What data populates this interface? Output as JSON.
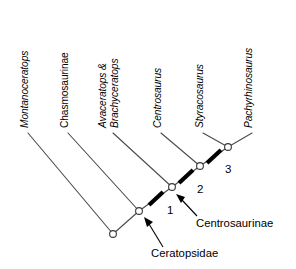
{
  "figure": {
    "type": "cladogram",
    "background_color": "#ffffff",
    "branch_color": "#4a4a4a",
    "node_fill": "#ffffff",
    "node_stroke": "#3a3a3a",
    "tick_color": "#000000"
  },
  "taxa": [
    {
      "id": "montanoceratops",
      "label": "Montanoceratops",
      "italic": true,
      "lines": [
        "Montanoceratops"
      ],
      "label_x": 28,
      "label_y": 126,
      "tip_x": 28,
      "tip_y": 133
    },
    {
      "id": "chasmosaurinae",
      "label": "Chasmosaurinae",
      "italic": false,
      "lines": [
        "Chasmosaurinae"
      ],
      "label_x": 68,
      "label_y": 126,
      "tip_x": 68,
      "tip_y": 133
    },
    {
      "id": "avaceratops-brachyceratops",
      "label": "Avaceratops & Brachyceratops",
      "italic": true,
      "lines": [
        "Avaceratops &",
        "Brachyceratops"
      ],
      "label_x": 113,
      "label_y": 126,
      "tip_x": 113,
      "tip_y": 133
    },
    {
      "id": "centrosaurus",
      "label": "Centrosaurus",
      "italic": true,
      "lines": [
        "Centrosaurus"
      ],
      "label_x": 161,
      "label_y": 126,
      "tip_x": 161,
      "tip_y": 133
    },
    {
      "id": "styracosaurus",
      "label": "Styracosaurus",
      "italic": true,
      "lines": [
        "Styracosaurus"
      ],
      "label_x": 203,
      "label_y": 126,
      "tip_x": 203,
      "tip_y": 133
    },
    {
      "id": "pachyrhinosaurus",
      "label": "Pachyrhinosaurus",
      "italic": true,
      "lines": [
        "Pachyrhinosaurus"
      ],
      "label_x": 252,
      "label_y": 126,
      "tip_x": 252,
      "tip_y": 133
    }
  ],
  "nodes": [
    {
      "id": "root",
      "x": 113,
      "y": 234
    },
    {
      "id": "ceratopsidae",
      "x": 139,
      "y": 211
    },
    {
      "id": "centrosaurinae",
      "x": 172,
      "y": 187
    },
    {
      "id": "node-2-above",
      "x": 200,
      "y": 166
    },
    {
      "id": "node-3-above",
      "x": 228,
      "y": 147
    }
  ],
  "tick_marks": [
    {
      "number": "1",
      "x": 156,
      "y": 198,
      "label_x": 166,
      "label_y": 213
    },
    {
      "number": "2",
      "x": 186,
      "y": 176,
      "label_x": 196,
      "label_y": 192
    },
    {
      "number": "3",
      "x": 214,
      "y": 156,
      "label_x": 224,
      "label_y": 172
    }
  ],
  "clade_labels": [
    {
      "id": "centrosaurinae-label",
      "text": "Centrosaurinae",
      "text_x": 196,
      "text_y": 226,
      "arrow_from_x": 197,
      "arrow_from_y": 216,
      "arrow_to_x": 178,
      "arrow_to_y": 196
    },
    {
      "id": "ceratopsidae-label",
      "text": "Ceratopsidae",
      "text_x": 152,
      "text_y": 256,
      "arrow_from_x": 162,
      "arrow_from_y": 246,
      "arrow_to_x": 145,
      "arrow_to_y": 220
    }
  ]
}
